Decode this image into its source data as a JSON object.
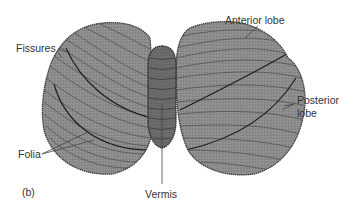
{
  "figure": {
    "panel_label": "(b)",
    "colors": {
      "background": "#ffffff",
      "hemisphere_fill": "#8c8c8c",
      "hemisphere_edge": "#3a3a3a",
      "vermis_fill": "#6b6b6b",
      "fissure_line": "#1e1e1e",
      "folia_line": "#4a4a4a",
      "label_text": "#333333",
      "leader_line": "#444444"
    }
  },
  "labels": {
    "anterior_lobe": "Anterior lobe",
    "fissures": "Fissures",
    "posterior_lobe_line1": "Posterior",
    "posterior_lobe_line2": "lobe",
    "folia": "Folia",
    "vermis": "Vermis"
  },
  "structures": [
    {
      "name": "left-hemisphere"
    },
    {
      "name": "right-hemisphere"
    },
    {
      "name": "vermis"
    }
  ]
}
